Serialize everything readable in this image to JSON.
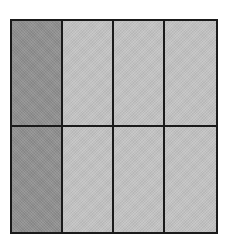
{
  "diagram": {
    "type": "fraction-area-model",
    "rows": 2,
    "columns": 4,
    "total_parts": 8,
    "shaded_parts": 2,
    "shaded_column": 1,
    "colors": {
      "shaded": "#8e8e8e",
      "unshaded": "#c2c2c2",
      "border": "#1a1a1a",
      "background": "#ffffff"
    },
    "cells": [
      {
        "row": 1,
        "col": 1,
        "shaded": true
      },
      {
        "row": 1,
        "col": 2,
        "shaded": false
      },
      {
        "row": 1,
        "col": 3,
        "shaded": false
      },
      {
        "row": 1,
        "col": 4,
        "shaded": false
      },
      {
        "row": 2,
        "col": 1,
        "shaded": true
      },
      {
        "row": 2,
        "col": 2,
        "shaded": false
      },
      {
        "row": 2,
        "col": 3,
        "shaded": false
      },
      {
        "row": 2,
        "col": 4,
        "shaded": false
      }
    ]
  }
}
